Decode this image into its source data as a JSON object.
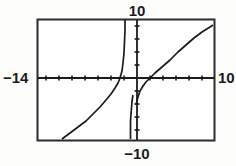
{
  "graph": {
    "window_labels": {
      "top": "10",
      "bottom": "−10",
      "left": "−14",
      "right": "10"
    },
    "frame": {
      "x0": 37,
      "y0": 19,
      "x1": 215,
      "y1": 141
    },
    "axes": {
      "x_axis_y": 78,
      "y_axis_x": 137,
      "tick_spacing": 13,
      "tick_length": 4
    }
  },
  "chart_data": {
    "type": "line",
    "title": "",
    "xlabel": "",
    "ylabel": "",
    "xlim": [
      -14,
      10
    ],
    "ylim": [
      -10,
      10
    ],
    "grid": false,
    "legend": null,
    "axis_ticks": {
      "x_tick_step": 1.75,
      "y_tick_step": 1.6,
      "x_ticks": [
        -14,
        -12.25,
        -10.5,
        -8.75,
        -7,
        -5.25,
        -3.5,
        -1.75,
        0,
        1.75,
        3.5,
        5.25,
        7,
        8.75,
        10
      ],
      "y_ticks": [
        -10,
        -8.4,
        -6.8,
        -5.2,
        -3.6,
        -2,
        -0.4,
        0,
        1.2,
        2.8,
        4.4,
        6,
        7.6,
        9.2
      ]
    },
    "series": [
      {
        "name": "left-branch",
        "comment": "increasing curve from lower-left, crosses x-axis near x=-2.3, steepens to vertical asymptote",
        "points_px": [
          [
            62,
            139
          ],
          [
            70,
            133
          ],
          [
            78,
            127
          ],
          [
            86,
            121
          ],
          [
            93,
            114
          ],
          [
            100,
            107
          ],
          [
            106,
            100
          ],
          [
            111,
            94
          ],
          [
            115,
            88
          ],
          [
            118,
            83
          ],
          [
            120,
            78
          ],
          [
            122,
            71
          ],
          [
            123,
            63
          ],
          [
            124,
            53
          ],
          [
            124.5,
            42
          ],
          [
            125,
            31
          ],
          [
            125,
            20
          ]
        ]
      },
      {
        "name": "center-branch",
        "comment": "near-vertical segment just left of the y-axis, descending from the asymptote",
        "points_px": [
          [
            133,
            95
          ],
          [
            132,
            101
          ],
          [
            131.5,
            108
          ],
          [
            131,
            114
          ],
          [
            130.5,
            121
          ],
          [
            130.5,
            128
          ],
          [
            130.5,
            134
          ],
          [
            130.5,
            139
          ]
        ]
      },
      {
        "name": "right-branch",
        "comment": "increasing curve from just right of y-axis up to upper-right corner",
        "points_px": [
          [
            136,
            105
          ],
          [
            138,
            97
          ],
          [
            140,
            91
          ],
          [
            143,
            86
          ],
          [
            146,
            82
          ],
          [
            150,
            78
          ],
          [
            155,
            73
          ],
          [
            162,
            67
          ],
          [
            170,
            60
          ],
          [
            178,
            52
          ],
          [
            186,
            45
          ],
          [
            194,
            38
          ],
          [
            202,
            32
          ],
          [
            210,
            27
          ],
          [
            213,
            25
          ]
        ]
      }
    ]
  }
}
